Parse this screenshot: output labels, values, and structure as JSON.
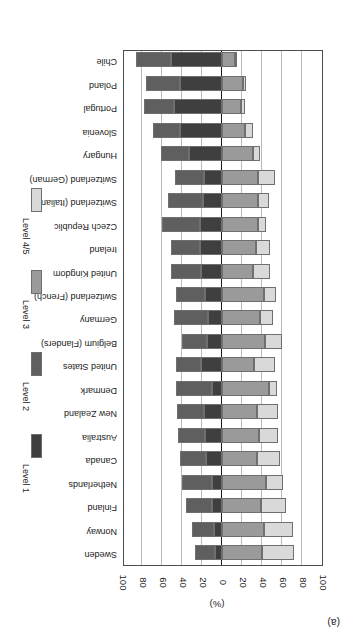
{
  "figure": {
    "panel_letter": "(a)",
    "axis_title": "(%)",
    "orientation": "rotated-180"
  },
  "legend": {
    "position": "right",
    "items": [
      {
        "label": "Level 1",
        "color": "#3f3f3f"
      },
      {
        "label": "Level 2",
        "color": "#5f5f5f"
      },
      {
        "label": "Level 3",
        "color": "#9a9a9a"
      },
      {
        "label": "Level 4/5",
        "color": "#d9d9d9"
      }
    ]
  },
  "axis": {
    "tick_labels": [
      "100",
      "80",
      "60",
      "40",
      "20",
      "0",
      "20",
      "40",
      "60",
      "80",
      "100"
    ],
    "tick_values": [
      -100,
      -80,
      -60,
      -40,
      -20,
      0,
      20,
      40,
      60,
      80,
      100
    ],
    "min": -100,
    "max": 100
  },
  "chart_data": {
    "type": "bar",
    "subtype": "diverging-stacked-horizontal",
    "title": "",
    "subtitle": "",
    "xlabel": "(%)",
    "ylabel": "",
    "xlim": [
      -100,
      100
    ],
    "grid": true,
    "legend_position": "right",
    "annotations": [
      "(a)"
    ],
    "note": "Percentages at Level 1 and Level 2 extend to the right of zero; Level 3 and Level 4/5 extend to the left of zero.",
    "categories": [
      "Sweden",
      "Norway",
      "Finland",
      "Netherlands",
      "Canada",
      "Australia",
      "New Zealand",
      "Denmark",
      "United States",
      "Belgium (Flanders)",
      "Germany",
      "Switzerland (French)",
      "United Kingdom",
      "Ireland",
      "Czech Republic",
      "Switzerland (Italian)",
      "Switzerland (German)",
      "Hungary",
      "Slovenia",
      "Portugal",
      "Poland",
      "Chile"
    ],
    "series": [
      {
        "name": "Level 1",
        "color": "#3f3f3f",
        "direction": "positive",
        "values": [
          7,
          8,
          10,
          10,
          16,
          17,
          18,
          10,
          21,
          15,
          14,
          17,
          21,
          22,
          22,
          19,
          18,
          33,
          42,
          48,
          42,
          51
        ]
      },
      {
        "name": "Level 2",
        "color": "#5f5f5f",
        "direction": "positive",
        "values": [
          20,
          22,
          26,
          30,
          26,
          27,
          27,
          36,
          25,
          25,
          34,
          29,
          30,
          29,
          38,
          35,
          29,
          28,
          27,
          30,
          34,
          35
        ]
      },
      {
        "name": "Level 3",
        "color": "#9a9a9a",
        "direction": "negative",
        "values": [
          40,
          42,
          39,
          44,
          35,
          37,
          35,
          47,
          32,
          43,
          38,
          42,
          31,
          34,
          36,
          36,
          36,
          31,
          23,
          19,
          21,
          13
        ]
      },
      {
        "name": "Level 4/5",
        "color": "#d9d9d9",
        "direction": "negative",
        "values": [
          32,
          29,
          25,
          17,
          23,
          19,
          21,
          8,
          21,
          17,
          13,
          12,
          17,
          14,
          8,
          11,
          17,
          7,
          8,
          4,
          3,
          2
        ]
      }
    ]
  }
}
